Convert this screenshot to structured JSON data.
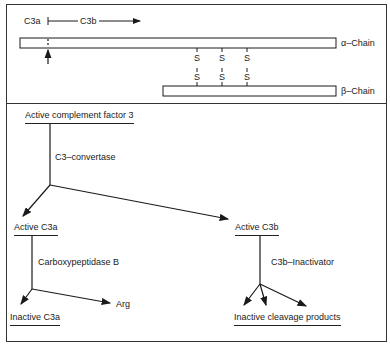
{
  "top_panel": {
    "c3a_label": "C3a",
    "c3b_label": "C3b",
    "alpha_chain_label": "α–Chain",
    "beta_chain_label": "β–Chain",
    "disulfide_bonds": [
      {
        "top": "S",
        "bottom": "S"
      },
      {
        "top": "S",
        "bottom": "S"
      },
      {
        "top": "S",
        "bottom": "S"
      }
    ]
  },
  "bottom_panel": {
    "root": "Active complement factor 3",
    "enzyme_1": "C3–convertase",
    "product_a": "Active C3a",
    "product_b": "Active C3b",
    "enzyme_a": "Carboxypeptidase B",
    "enzyme_b": "C3b–Inactivator",
    "result_a": "Inactive C3a",
    "result_a_side": "Arg",
    "result_b": "Inactive cleavage products"
  }
}
